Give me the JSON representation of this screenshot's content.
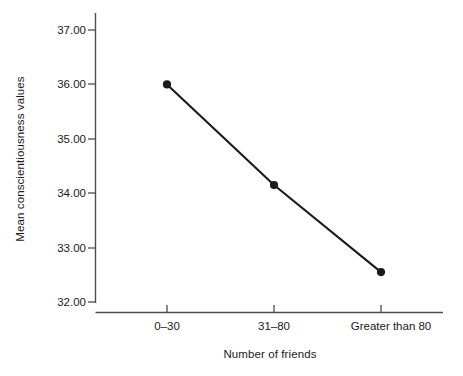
{
  "chart_data": {
    "type": "line",
    "title": "",
    "subtitle": "",
    "xlabel": "Number of friends",
    "ylabel": "Mean conscientiousness values",
    "categories": [
      "0–30",
      "31–80",
      "Greater than 80"
    ],
    "values": [
      36.0,
      34.15,
      32.55
    ],
    "series": [
      {
        "name": "Mean conscientiousness values",
        "values": [
          36.0,
          34.15,
          32.55
        ]
      }
    ],
    "ylim": [
      32.0,
      37.0
    ],
    "ytick_labels": [
      "37.00",
      "36.00",
      "35.00",
      "34.00",
      "33.00",
      "32.00"
    ],
    "ytick_values": [
      37.0,
      36.0,
      35.0,
      34.0,
      33.0,
      32.0
    ],
    "grid": false,
    "legend": "none",
    "marker": "filled-circle",
    "line_color": "#1a1a1a",
    "marker_color": "#1a1a1a",
    "axis_color": "#4d4d4d",
    "background": "#ffffff"
  },
  "axis": {
    "y_title": "Mean conscientiousness values",
    "x_title": "Number of friends"
  }
}
